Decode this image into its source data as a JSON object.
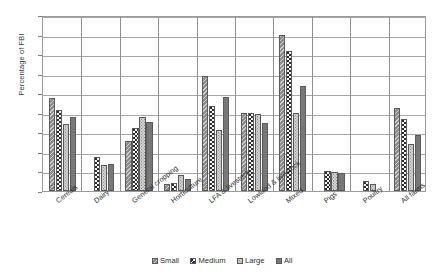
{
  "chart_data": {
    "type": "bar",
    "title": "",
    "xlabel": "",
    "ylabel": "Percentage of FBI",
    "ylim": [
      0,
      180
    ],
    "ytick_step": 20,
    "yticks": [
      0,
      20,
      40,
      60,
      80,
      100,
      120,
      140,
      160,
      180
    ],
    "grid": true,
    "legend_position": "bottom",
    "categories": [
      "Cereals",
      "Dairy",
      "General cropping",
      "Horticulture",
      "LFA & livestock",
      "Lowland & livestock",
      "Mixed",
      "Pigs",
      "Poultry",
      "All farms"
    ],
    "series": [
      {
        "name": "Small",
        "pattern": "diagonal-hatch",
        "color": "#8d8d8d",
        "values": [
          95,
          null,
          51,
          7,
          118,
          80,
          160,
          null,
          null,
          85
        ]
      },
      {
        "name": "Medium",
        "pattern": "checkerboard",
        "color": "#2e2e2e",
        "values": [
          83,
          35,
          64,
          8,
          87,
          80,
          143,
          20,
          10,
          74
        ]
      },
      {
        "name": "Large",
        "pattern": "fine-dots",
        "color": "#d2d2d2",
        "values": [
          69,
          27,
          76,
          16,
          62,
          79,
          80,
          19,
          7,
          48
        ]
      },
      {
        "name": "All",
        "pattern": "solid",
        "color": "#787878",
        "values": [
          76,
          28,
          71,
          12,
          96,
          70,
          107,
          18,
          null,
          57
        ]
      }
    ]
  },
  "legend": {
    "items": [
      {
        "label": "Small"
      },
      {
        "label": "Medium"
      },
      {
        "label": "Large"
      },
      {
        "label": "All"
      }
    ]
  }
}
